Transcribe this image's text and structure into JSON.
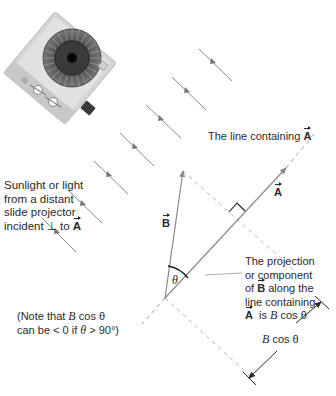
{
  "labels": {
    "light_source": [
      "Sunlight or light",
      "from a distant",
      "slide projector",
      "incident ⊥ to "
    ],
    "light_source_vector": "A",
    "line_containing_prefix": "The line containing ",
    "line_containing_vector": "A",
    "vector_a": "A",
    "vector_b": "B",
    "theta": "θ",
    "projection": {
      "line1": "The projection",
      "line2": "or component",
      "line3_prefix": "of ",
      "line3_vector": "B",
      "line3_suffix": " along the",
      "line4": "line containing",
      "line5_vector": "A",
      "line5_mid": "  is ",
      "line5_expr": "B",
      "line5_end": " cos θ"
    },
    "note": {
      "line1_prefix": "(Note that ",
      "line1_expr": "B",
      "line1_end": " cos θ",
      "line2_prefix": "can be < 0 if ",
      "line2_theta": "θ",
      "line2_end": " > 90°)"
    },
    "dimension": {
      "expr": "B",
      "end": " cos θ"
    }
  },
  "icons": {
    "projector": "slide-projector-illustration",
    "light_ray": "arrow-ray"
  },
  "colors": {
    "line": "#8a8a8a",
    "dash": "#b0b0b0",
    "text": "#2a2a2a",
    "arc": "#1a1a1a"
  }
}
